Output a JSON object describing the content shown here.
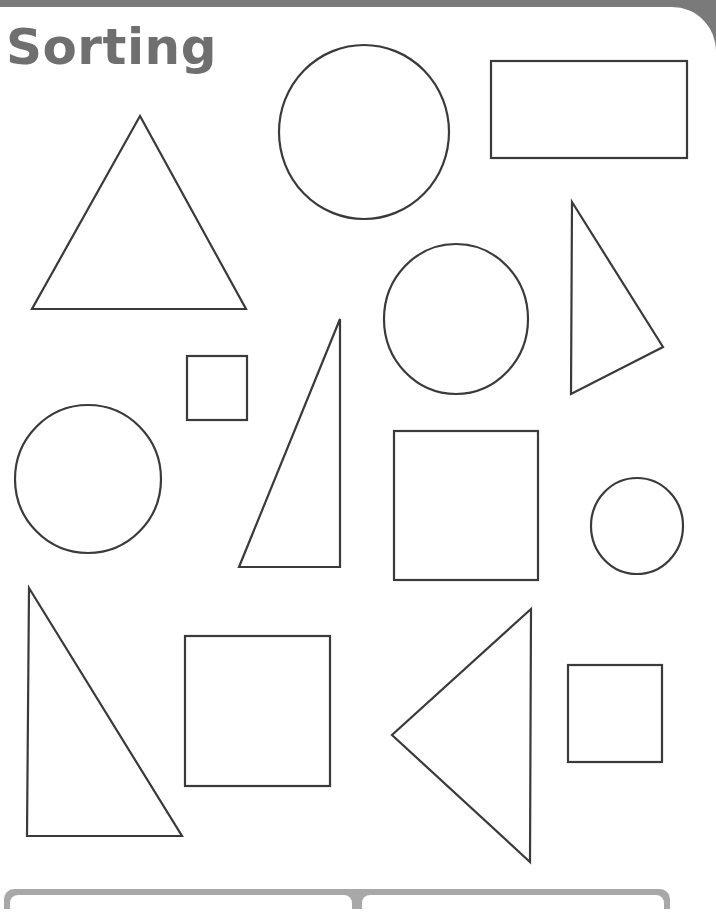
{
  "worksheet": {
    "title": "Sorting",
    "title_color": "#6f6f6f",
    "stroke_color": "#3a3a3a",
    "frame_color": "#7a7a7a"
  },
  "shapes": [
    {
      "type": "triangle",
      "points": "140,116 32,309 246,309"
    },
    {
      "type": "circle",
      "cx": 364,
      "cy": 132,
      "rx": 85,
      "ry": 87
    },
    {
      "type": "rectangle",
      "x": 491,
      "y": 61,
      "w": 196,
      "h": 97
    },
    {
      "type": "circle",
      "cx": 456,
      "cy": 319,
      "rx": 72,
      "ry": 75
    },
    {
      "type": "triangle",
      "points": "572,202 663,347 571,394"
    },
    {
      "type": "square",
      "x": 187,
      "y": 356,
      "w": 60,
      "h": 64
    },
    {
      "type": "triangle",
      "points": "340,319 340,567 239,567"
    },
    {
      "type": "circle",
      "cx": 88,
      "cy": 479,
      "rx": 73,
      "ry": 74
    },
    {
      "type": "square",
      "x": 394,
      "y": 431,
      "w": 144,
      "h": 149
    },
    {
      "type": "circle",
      "cx": 637,
      "cy": 526,
      "rx": 46,
      "ry": 48
    },
    {
      "type": "triangle",
      "points": "29,588 27,836 182,836"
    },
    {
      "type": "square",
      "x": 185,
      "y": 636,
      "w": 145,
      "h": 150
    },
    {
      "type": "triangle",
      "points": "531,609 392,735 530,862"
    },
    {
      "type": "square",
      "x": 568,
      "y": 665,
      "w": 94,
      "h": 97
    }
  ]
}
